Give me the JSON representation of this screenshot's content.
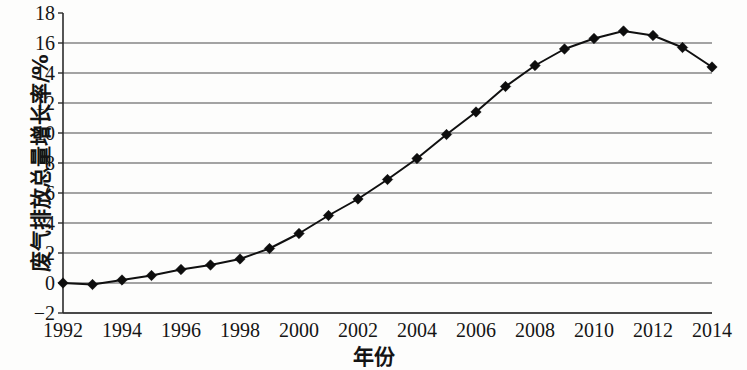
{
  "chart_data": {
    "type": "line",
    "title": "",
    "xlabel": "年份",
    "ylabel": "废气排放总量增长率/%",
    "x": [
      1992,
      1993,
      1994,
      1995,
      1996,
      1997,
      1998,
      1999,
      2000,
      2001,
      2002,
      2003,
      2004,
      2005,
      2006,
      2007,
      2008,
      2009,
      2010,
      2011,
      2012,
      2013,
      2014
    ],
    "values": [
      0.0,
      -0.1,
      0.2,
      0.5,
      0.9,
      1.2,
      1.6,
      2.3,
      3.3,
      4.5,
      5.6,
      6.9,
      8.3,
      9.9,
      11.4,
      13.1,
      14.5,
      15.6,
      16.3,
      16.8,
      16.5,
      15.7,
      14.4
    ],
    "series": [
      {
        "name": "废气排放总量增长率",
        "values": [
          0.0,
          -0.1,
          0.2,
          0.5,
          0.9,
          1.2,
          1.6,
          2.3,
          3.3,
          4.5,
          5.6,
          6.9,
          8.3,
          9.9,
          11.4,
          13.1,
          14.5,
          15.6,
          16.3,
          16.8,
          16.5,
          15.7,
          14.4
        ]
      }
    ],
    "ylim": [
      -2,
      18
    ],
    "xlim": [
      1992,
      2014
    ],
    "yticks": [
      18,
      16,
      14,
      12,
      10,
      8,
      6,
      4,
      2,
      0,
      -2
    ],
    "ytick_labels": [
      "18",
      "16",
      "14",
      "12",
      "10",
      "8",
      "6",
      "4",
      "2",
      "0",
      "−2"
    ],
    "xticks": [
      1992,
      1994,
      1996,
      1998,
      2000,
      2002,
      2004,
      2006,
      2008,
      2010,
      2012,
      2014
    ],
    "xtick_labels": [
      "1992",
      "1994",
      "1996",
      "1998",
      "2000",
      "2002",
      "2004",
      "2006",
      "2008",
      "2010",
      "2012",
      "2014"
    ],
    "grid": "horizontal",
    "legend": "none",
    "marker": "diamond",
    "line_color": "#101010",
    "marker_color": "#0d0d0d",
    "grid_color": "#4a4a4a",
    "background_color": "#fdfdfc"
  }
}
